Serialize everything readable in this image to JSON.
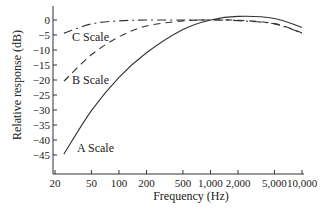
{
  "chart_data": {
    "type": "line",
    "title": "",
    "xlabel": "Frequency (Hz)",
    "ylabel": "Relative response (dB)",
    "xscale": "log",
    "xlim": [
      20,
      10000
    ],
    "ylim": [
      -47,
      3
    ],
    "x_ticks": [
      20,
      50,
      100,
      200,
      500,
      1000,
      2000,
      5000,
      10000
    ],
    "x_tick_labels": [
      "20",
      "50",
      "100",
      "200",
      "500",
      "1,000",
      "2,000",
      "5,000",
      "10,000"
    ],
    "y_ticks": [
      0,
      -5,
      -10,
      -15,
      -20,
      -25,
      -30,
      -35,
      -40,
      -45
    ],
    "y_tick_labels": [
      "0",
      "−5",
      "−10",
      "−15",
      "−20",
      "−25",
      "−30",
      "−35",
      "−40",
      "−45"
    ],
    "grid": false,
    "legend": "inline labels",
    "series": [
      {
        "name": "A Scale",
        "style": "solid",
        "x": [
          25,
          50,
          100,
          200,
          500,
          1000,
          2000,
          5000,
          10000
        ],
        "y": [
          -44.7,
          -30.2,
          -19.1,
          -10.9,
          -3.2,
          0,
          1.2,
          0.5,
          -2.5
        ]
      },
      {
        "name": "B Scale",
        "style": "dashed",
        "x": [
          25,
          50,
          100,
          200,
          500,
          1000,
          2000,
          5000,
          10000
        ],
        "y": [
          -20.4,
          -11.6,
          -5.6,
          -2.0,
          -0.3,
          0,
          -0.1,
          -1.2,
          -4.3
        ]
      },
      {
        "name": "C Scale",
        "style": "dash-dot",
        "x": [
          25,
          50,
          100,
          200,
          500,
          1000,
          2000,
          5000,
          10000
        ],
        "y": [
          -4.4,
          -1.3,
          -0.3,
          0,
          0,
          0,
          -0.2,
          -1.3,
          -4.4
        ]
      }
    ]
  },
  "labels": {
    "c_scale": "C Scale",
    "b_scale": "B Scale",
    "a_scale": "A Scale"
  }
}
